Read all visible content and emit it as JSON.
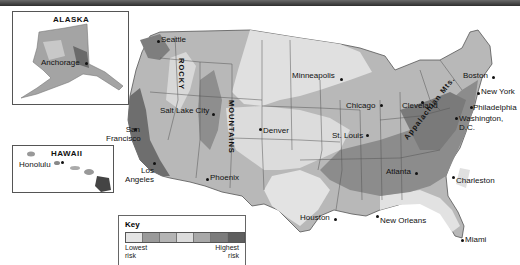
{
  "insets": {
    "alaska": {
      "title": "ALASKA",
      "cities": [
        {
          "name": "Anchorage"
        }
      ]
    },
    "hawaii": {
      "title": "HAWAII",
      "cities": [
        {
          "name": "Honolulu"
        }
      ]
    }
  },
  "mountain_labels": {
    "rocky": "ROCKY",
    "mountains": "MOUNTAINS",
    "appalachian": "Appalachian Mts."
  },
  "cities": {
    "seattle": "Seattle",
    "san_francisco": "San Francisco",
    "los_angeles": "Los Angeles",
    "salt_lake_city": "Salt Lake City",
    "phoenix": "Phoenix",
    "denver": "Denver",
    "minneapolis": "Minneapolis",
    "chicago": "Chicago",
    "st_louis": "St. Louis",
    "houston": "Houston",
    "new_orleans": "New Orleans",
    "atlanta": "Atlanta",
    "miami": "Miami",
    "charleston": "Charleston",
    "cleveland": "Cleveland",
    "washington": "Washington, D.C.",
    "philadelphia": "Philadelphia",
    "new_york": "New York",
    "boston": "Boston"
  },
  "key": {
    "title": "Key",
    "low_label_1": "Lowest",
    "low_label_2": "risk",
    "high_label_1": "Highest",
    "high_label_2": "risk",
    "swatch_colors": [
      "#e4e4e4",
      "#9a9a9a",
      "#b4b4b4",
      "#dcdcdc",
      "#a8a8a8",
      "#7c7c7c",
      "#5e5e5e"
    ]
  },
  "colors": {
    "land_low": "#e2e2e2",
    "land_mid": "#b3b3b3",
    "land_high": "#8a8a8a",
    "land_highest": "#5e5e5e",
    "water": "#ffffff",
    "border": "#555555"
  }
}
